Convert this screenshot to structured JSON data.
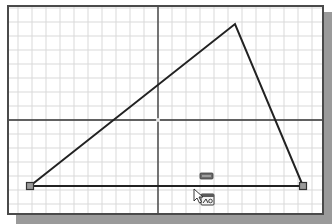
{
  "viewport": {
    "name": "sketch-viewport",
    "background": "#ffffff",
    "frame_color": "#4a4a4a",
    "shadow_color": "#9a9a9a",
    "grid": {
      "spacing": 14,
      "color": "#d9d9d9"
    },
    "axes": {
      "origin": [
        156,
        118
      ],
      "color": "#333333"
    }
  },
  "sketch": {
    "line_color": "#222222",
    "triangle": {
      "vertices": [
        [
          28,
          184
        ],
        [
          233,
          22
        ],
        [
          301,
          184
        ]
      ]
    },
    "endpoints": [
      {
        "x": 28,
        "y": 184
      },
      {
        "x": 301,
        "y": 184
      }
    ],
    "endpoint_fill": "#9a9a9a"
  },
  "constraint_icons": [
    {
      "name": "horizontal-constraint-icon",
      "x": 204,
      "y": 174
    },
    {
      "name": "dimension-constraint-icon",
      "x": 205,
      "y": 197
    }
  ],
  "cursor": {
    "name": "arrow-cursor",
    "x": 192,
    "y": 187
  }
}
